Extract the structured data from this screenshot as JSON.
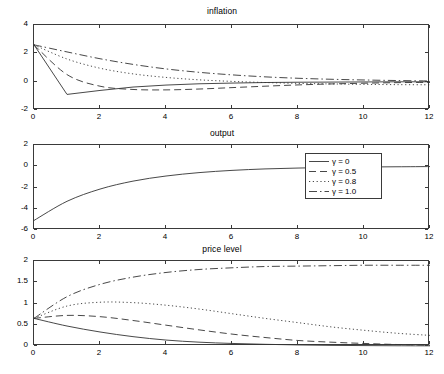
{
  "figure": {
    "background": "#ffffff",
    "line_color": "#333333"
  },
  "legend": {
    "position": "middle-right",
    "entries": [
      {
        "label": "γ = 0",
        "style": "solid"
      },
      {
        "label": "γ = 0.5",
        "style": "dashed"
      },
      {
        "label": "γ = 0.8",
        "style": "dotted"
      },
      {
        "label": "γ = 1.0",
        "style": "dashdot"
      }
    ]
  },
  "chart_data": [
    {
      "type": "line",
      "title": "inflation",
      "xlabel": "",
      "ylabel": "",
      "xlim": [
        0,
        12
      ],
      "ylim": [
        -2,
        4
      ],
      "xticks": [
        0,
        2,
        4,
        6,
        8,
        10,
        12
      ],
      "yticks": [
        -2,
        0,
        2,
        4
      ],
      "xticklabels": [
        "0",
        "2",
        "4",
        "6",
        "8",
        "10",
        "12"
      ],
      "yticklabels": [
        "-2",
        "0",
        "2",
        "4"
      ],
      "grid": false,
      "legend": "none",
      "x": [
        0,
        1,
        2,
        3,
        4,
        5,
        6,
        7,
        8,
        9,
        10,
        11,
        12
      ],
      "series": [
        {
          "name": "γ = 0",
          "style": "solid",
          "values": [
            2.6,
            -0.9,
            -0.62,
            -0.38,
            -0.24,
            -0.15,
            -0.1,
            -0.06,
            -0.04,
            -0.03,
            -0.02,
            -0.01,
            -0.01
          ]
        },
        {
          "name": "γ = 0.5",
          "style": "dashed",
          "values": [
            2.6,
            0.5,
            -0.32,
            -0.55,
            -0.58,
            -0.52,
            -0.42,
            -0.32,
            -0.23,
            -0.16,
            -0.11,
            -0.07,
            -0.05
          ]
        },
        {
          "name": "γ = 0.8",
          "style": "dotted",
          "values": [
            2.6,
            1.6,
            0.95,
            0.55,
            0.3,
            0.13,
            0.02,
            -0.06,
            -0.12,
            -0.16,
            -0.19,
            -0.21,
            -0.22
          ]
        },
        {
          "name": "γ = 1.0",
          "style": "dashdot",
          "values": [
            2.6,
            2.1,
            1.62,
            1.22,
            0.9,
            0.66,
            0.48,
            0.34,
            0.24,
            0.17,
            0.12,
            0.08,
            0.05
          ]
        }
      ]
    },
    {
      "type": "line",
      "title": "output",
      "xlabel": "",
      "ylabel": "",
      "xlim": [
        0,
        12
      ],
      "ylim": [
        -6,
        2
      ],
      "xticks": [
        0,
        2,
        4,
        6,
        8,
        10,
        12
      ],
      "yticks": [
        -6,
        -4,
        -2,
        0,
        2
      ],
      "xticklabels": [
        "0",
        "2",
        "4",
        "6",
        "8",
        "10",
        "12"
      ],
      "yticklabels": [
        "-6",
        "-4",
        "-2",
        "0",
        "2"
      ],
      "grid": false,
      "legend": "inside-right",
      "x": [
        0,
        1,
        2,
        3,
        4,
        5,
        6,
        7,
        8,
        9,
        10,
        11,
        12
      ],
      "series": [
        {
          "name": "γ = 0",
          "style": "solid",
          "values": [
            -5.1,
            -3.3,
            -2.15,
            -1.4,
            -0.92,
            -0.6,
            -0.39,
            -0.25,
            -0.17,
            -0.11,
            -0.07,
            -0.05,
            -0.03
          ]
        },
        {
          "name": "γ = 0.5",
          "style": "dashed",
          "values": [
            -5.1,
            -3.3,
            -2.15,
            -1.4,
            -0.92,
            -0.6,
            -0.39,
            -0.25,
            -0.17,
            -0.11,
            -0.07,
            -0.05,
            -0.03
          ]
        },
        {
          "name": "γ = 0.8",
          "style": "dotted",
          "values": [
            -5.1,
            -3.3,
            -2.15,
            -1.4,
            -0.92,
            -0.6,
            -0.39,
            -0.25,
            -0.17,
            -0.11,
            -0.07,
            -0.05,
            -0.03
          ]
        },
        {
          "name": "γ = 1.0",
          "style": "dashdot",
          "values": [
            -5.1,
            -3.3,
            -2.15,
            -1.4,
            -0.92,
            -0.6,
            -0.39,
            -0.25,
            -0.17,
            -0.11,
            -0.07,
            -0.05,
            -0.03
          ]
        }
      ]
    },
    {
      "type": "line",
      "title": "price level",
      "xlabel": "",
      "ylabel": "",
      "xlim": [
        0,
        12
      ],
      "ylim": [
        0,
        2
      ],
      "xticks": [
        0,
        2,
        4,
        6,
        8,
        10,
        12
      ],
      "yticks": [
        0,
        0.5,
        1,
        1.5,
        2
      ],
      "xticklabels": [
        "0",
        "2",
        "4",
        "6",
        "8",
        "10",
        "12"
      ],
      "yticklabels": [
        "0",
        "0.5",
        "1",
        "1.5",
        "2"
      ],
      "grid": false,
      "legend": "none",
      "x": [
        0,
        1,
        2,
        3,
        4,
        5,
        6,
        7,
        8,
        9,
        10,
        11,
        12
      ],
      "series": [
        {
          "name": "γ = 0",
          "style": "solid",
          "values": [
            0.65,
            0.47,
            0.33,
            0.22,
            0.14,
            0.09,
            0.06,
            0.04,
            0.025,
            0.015,
            0.01,
            0.006,
            0.004
          ]
        },
        {
          "name": "γ = 0.5",
          "style": "dashed",
          "values": [
            0.65,
            0.72,
            0.69,
            0.6,
            0.49,
            0.38,
            0.28,
            0.2,
            0.13,
            0.09,
            0.06,
            0.035,
            0.02
          ]
        },
        {
          "name": "γ = 0.8",
          "style": "dotted",
          "values": [
            0.65,
            0.94,
            1.03,
            1.02,
            0.96,
            0.87,
            0.76,
            0.65,
            0.55,
            0.45,
            0.37,
            0.3,
            0.25
          ]
        },
        {
          "name": "γ = 1.0",
          "style": "dashdot",
          "values": [
            0.65,
            1.16,
            1.45,
            1.62,
            1.73,
            1.8,
            1.84,
            1.87,
            1.88,
            1.89,
            1.9,
            1.9,
            1.9
          ]
        }
      ]
    }
  ]
}
